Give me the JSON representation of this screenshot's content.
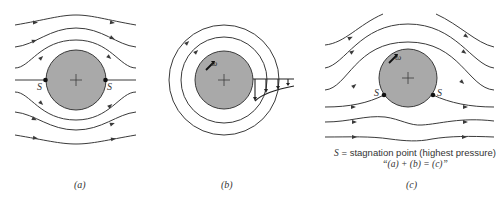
{
  "figure": {
    "panels": [
      {
        "id": "a",
        "label": "(a)",
        "description": "Uniform flow past a stationary cylinder",
        "stagnation_labels": [
          "S",
          "S"
        ]
      },
      {
        "id": "b",
        "label": "(b)",
        "description": "Rotating cylinder with circulatory flow and velocity profile",
        "rotation_label": "ω"
      },
      {
        "id": "c",
        "label": "(c)",
        "description": "Uniform flow past a rotating cylinder",
        "rotation_label": "ω",
        "stagnation_labels": [
          "S",
          "S"
        ]
      }
    ],
    "legend": {
      "symbol": "S",
      "definition": " = stagnation point (highest pressure)",
      "equation": "“(a) + (b) = (c)”"
    },
    "colors": {
      "cylinder_fill": "#a9a9a9",
      "line": "#3a3a3a",
      "background": "#ffffff"
    }
  }
}
